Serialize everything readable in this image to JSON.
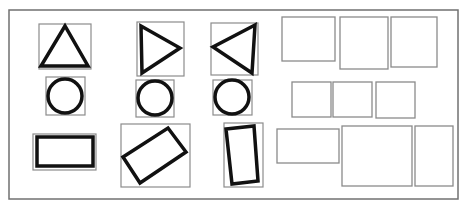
{
  "canvas": {
    "width": 467,
    "height": 209,
    "background": "#ffffff",
    "frame": {
      "x": 9,
      "y": 10,
      "w": 449,
      "h": 189,
      "stroke": "#707070"
    },
    "bbox_color": "#8c8c8c",
    "shape_color": "#111111",
    "placeholder_color": "#8a8a8a"
  },
  "shapes": [
    {
      "name": "triangle-up",
      "kind": "polygon",
      "bbox": {
        "x": 39,
        "y": 24,
        "w": 52,
        "h": 45
      },
      "points": "65,26 41,66 88,66"
    },
    {
      "name": "triangle-right",
      "kind": "polygon",
      "bbox": {
        "x": 137,
        "y": 22,
        "w": 47,
        "h": 54
      },
      "points": "141,26 180,48 142,73"
    },
    {
      "name": "triangle-left",
      "kind": "polygon",
      "bbox": {
        "x": 211,
        "y": 23,
        "w": 47,
        "h": 52
      },
      "points": "255,25 213,47 252,73"
    },
    {
      "name": "circle-1",
      "kind": "circle",
      "bbox": {
        "x": 46,
        "y": 77,
        "w": 39,
        "h": 38
      },
      "cx": 65,
      "cy": 96,
      "r": 17
    },
    {
      "name": "circle-2",
      "kind": "circle",
      "bbox": {
        "x": 136,
        "y": 80,
        "w": 38,
        "h": 37
      },
      "cx": 155,
      "cy": 98,
      "r": 17
    },
    {
      "name": "circle-3",
      "kind": "circle",
      "bbox": {
        "x": 213,
        "y": 80,
        "w": 39,
        "h": 35
      },
      "cx": 232,
      "cy": 97,
      "r": 17
    },
    {
      "name": "rectangle-horizontal",
      "kind": "polygon",
      "bbox": {
        "x": 33,
        "y": 134,
        "w": 63,
        "h": 36
      },
      "points": "37,137 93,137 93,166 37,166"
    },
    {
      "name": "rectangle-rotated",
      "kind": "polygon",
      "bbox": {
        "x": 121,
        "y": 124,
        "w": 69,
        "h": 63
      },
      "points": "123,157 168,128 186,152 140,183"
    },
    {
      "name": "rectangle-vertical",
      "kind": "polygon",
      "bbox": {
        "x": 224,
        "y": 123,
        "w": 39,
        "h": 64
      },
      "points": "226,129 254,126 258,181 232,184"
    }
  ],
  "placeholders": [
    {
      "name": "placeholder-top-1",
      "x": 282,
      "y": 17,
      "w": 53,
      "h": 44
    },
    {
      "name": "placeholder-top-2",
      "x": 340,
      "y": 17,
      "w": 48,
      "h": 52
    },
    {
      "name": "placeholder-top-3",
      "x": 391,
      "y": 17,
      "w": 46,
      "h": 50
    },
    {
      "name": "placeholder-mid-1",
      "x": 292,
      "y": 82,
      "w": 39,
      "h": 35
    },
    {
      "name": "placeholder-mid-2",
      "x": 333,
      "y": 82,
      "w": 39,
      "h": 35
    },
    {
      "name": "placeholder-mid-3",
      "x": 376,
      "y": 82,
      "w": 39,
      "h": 36
    },
    {
      "name": "placeholder-bottom-1",
      "x": 277,
      "y": 129,
      "w": 62,
      "h": 34
    },
    {
      "name": "placeholder-bottom-2",
      "x": 342,
      "y": 126,
      "w": 70,
      "h": 60
    },
    {
      "name": "placeholder-bottom-3",
      "x": 415,
      "y": 126,
      "w": 38,
      "h": 60
    }
  ]
}
